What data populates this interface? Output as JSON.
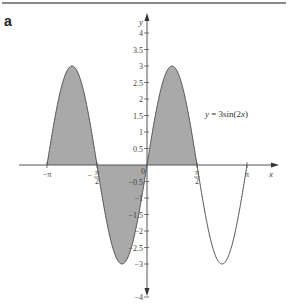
{
  "panel_label": "a",
  "chart_data": {
    "type": "line",
    "title": "",
    "function": "3sin(2x)",
    "annotation": "y = 3sin(2x)",
    "xlabel": "x",
    "ylabel": "y",
    "xlim": [
      -3.14159,
      3.14159
    ],
    "ylim": [
      -4,
      4
    ],
    "grid": false,
    "shaded_region": {
      "from": -3.14159,
      "to": 1.5708,
      "color": "#a9a9a9"
    },
    "curve_color": "#555555",
    "x_ticks": [
      {
        "value": -3.14159,
        "label": "−π"
      },
      {
        "value": -1.5708,
        "label": "−π/2"
      },
      {
        "value": 0,
        "label": "0"
      },
      {
        "value": 1.5708,
        "label": "π/2"
      },
      {
        "value": 3.14159,
        "label": "π"
      }
    ],
    "y_ticks": [
      {
        "value": 4,
        "label": "4"
      },
      {
        "value": 3.5,
        "label": "3.5"
      },
      {
        "value": 3,
        "label": "3"
      },
      {
        "value": 2.5,
        "label": "2.5"
      },
      {
        "value": 2,
        "label": "2"
      },
      {
        "value": 1.5,
        "label": "1.5"
      },
      {
        "value": 1,
        "label": "1"
      },
      {
        "value": 0.5,
        "label": "0.5"
      },
      {
        "value": -0.5,
        "label": "−0.5"
      },
      {
        "value": -1,
        "label": "−1"
      },
      {
        "value": -1.5,
        "label": "−1.5"
      },
      {
        "value": -2,
        "label": "−2"
      },
      {
        "value": -2.5,
        "label": "−2.5"
      },
      {
        "value": -3,
        "label": "−3"
      },
      {
        "value": -4,
        "label": "−4"
      }
    ],
    "key_points": [
      {
        "x": -3.14159,
        "y": 0
      },
      {
        "x": -2.35619,
        "y": 3
      },
      {
        "x": -1.5708,
        "y": 0
      },
      {
        "x": -0.7854,
        "y": -3
      },
      {
        "x": 0,
        "y": 0
      },
      {
        "x": 0.7854,
        "y": 3
      },
      {
        "x": 1.5708,
        "y": 0
      },
      {
        "x": 2.35619,
        "y": -3
      },
      {
        "x": 3.14159,
        "y": 0
      }
    ]
  }
}
